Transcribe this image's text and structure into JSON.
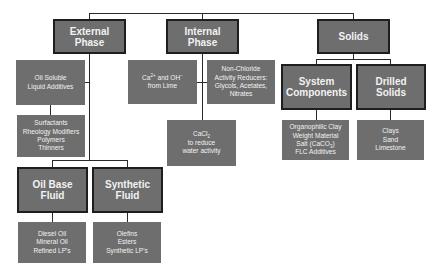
{
  "diagram": {
    "colors": {
      "box_fill": "#6e6e6e",
      "box_border": "#1e1e1e",
      "box_text": "#f2f2f2",
      "connector": "#2a2a2a",
      "background": "#ffffff"
    },
    "categories": {
      "external_phase": {
        "title_lines": [
          "External",
          "Phase"
        ],
        "children": {
          "oil_soluble": {
            "lines": [
              "Oil Soluble",
              "Liquid Additives"
            ]
          },
          "additives_list": {
            "lines": [
              "Surfactants",
              "Rheology Modifiers",
              "Polymers",
              "Thinners"
            ]
          },
          "oil_base_fluid": {
            "title_lines": [
              "Oil Base",
              "Fluid"
            ],
            "items": [
              "Diesel Oil",
              "Mineral Oil",
              "Refined LP's"
            ]
          },
          "synthetic_fluid": {
            "title_lines": [
              "Synthetic",
              "Fluid"
            ],
            "items": [
              "Olefins",
              "Esters",
              "Synthetic LP's"
            ]
          }
        }
      },
      "internal_phase": {
        "title_lines": [
          "Internal",
          "Phase"
        ],
        "children": {
          "lime": {
            "ca": "Ca",
            "ca_sup": "2+",
            "mid": " and OH",
            "oh_sup": "−",
            "line2": "from Lime"
          },
          "non_chloride": {
            "lines": [
              "Non-Chloride",
              "Activity Reducers:",
              "Glycols, Acetates,",
              "Nitrates"
            ]
          },
          "cacl2": {
            "cacl": "CaCl",
            "sub": "2",
            "line2": "to reduce",
            "line3": "water activity"
          }
        }
      },
      "solids": {
        "title_lines": [
          "Solids"
        ],
        "children": {
          "system_components": {
            "title_lines": [
              "System",
              "Components"
            ],
            "items": [
              "Organophilic Clay",
              "Weight Material"
            ],
            "salt_prefix": "Salt (CaCO",
            "salt_sub": "3",
            "salt_suffix": ")",
            "last_item": "FLC Additives"
          },
          "drilled_solids": {
            "title_lines": [
              "Drilled",
              "Solids"
            ],
            "items": [
              "Clays",
              "Sand",
              "Limestone"
            ]
          }
        }
      }
    }
  }
}
